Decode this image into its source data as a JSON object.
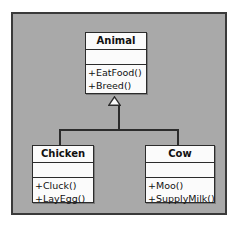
{
  "diagram": {
    "type": "uml-class-diagram",
    "title": "",
    "canvas": {
      "background_color": "#a9a9a9",
      "border_color": "#3a3a3a",
      "page_background_color": "#ffffff"
    },
    "classes": [
      {
        "id": "animal",
        "name": "Animal",
        "attributes": [],
        "operations": [
          "+EatFood()",
          "+Breed()"
        ]
      },
      {
        "id": "chicken",
        "name": "Chicken",
        "attributes": [],
        "operations": [
          "+Cluck()",
          "+LayEgg()"
        ]
      },
      {
        "id": "cow",
        "name": "Cow",
        "attributes": [],
        "operations": [
          "+Moo()",
          "+SupplyMilk()"
        ]
      }
    ],
    "relationships": [
      {
        "kind": "generalization",
        "from": "Chicken",
        "to": "Animal",
        "arrowhead": "hollow-triangle"
      },
      {
        "kind": "generalization",
        "from": "Cow",
        "to": "Animal",
        "arrowhead": "hollow-triangle"
      }
    ],
    "colors": {
      "class_fill": "#fbfbfb",
      "line": "#2c2c2c",
      "text": "#111111"
    }
  }
}
